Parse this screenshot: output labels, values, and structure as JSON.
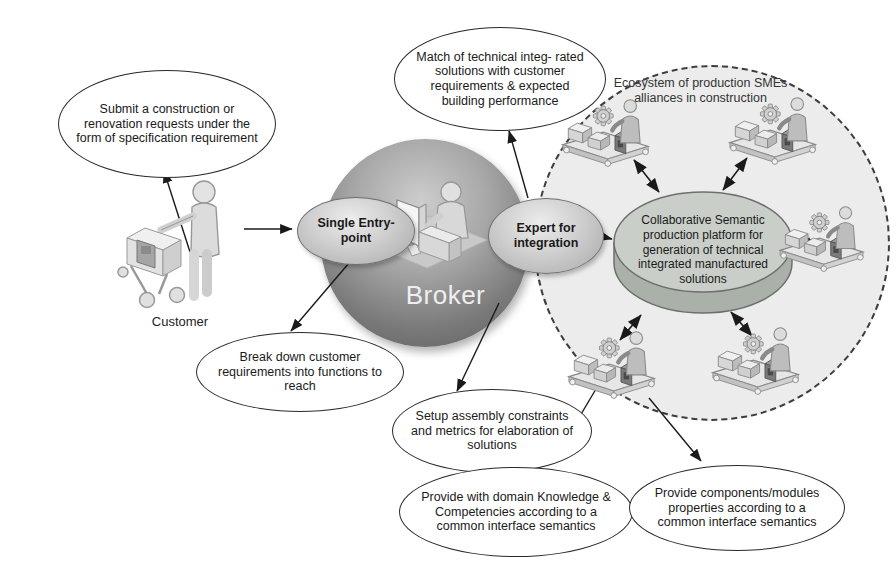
{
  "labels": {
    "broker": "Broker",
    "customer": "Customer"
  },
  "nodes": {
    "submit": "Submit a construction or renovation requests under the form of specification requirement",
    "match": "Match of technical integ- rated solutions with customer requirements & expected building performance",
    "ecosystem": "Ecosystem of production SMEs alliances in construction",
    "platform": "Collaborative Semantic production platform for generation of technical integrated manufactured solutions",
    "single_entry": "Single Entry-point",
    "expert": "Expert for integration",
    "break_down": "Break down customer requirements into functions to reach",
    "setup": "Setup assembly constraints and metrics for elaboration of solutions",
    "knowledge": "Provide with domain Knowledge & Competencies according to a common interface semantics",
    "components": "Provide components/modules properties according to a common interface semantics"
  },
  "icons": {
    "customer": "person-pushing-cart-icon",
    "broker": "person-at-computer-icon",
    "sme": "factory-worker-icon"
  },
  "colors": {
    "background": "#ffffff",
    "broker_sphere": "#6f6f6f",
    "gray_node": "#c3c3c3",
    "ecosystem_fill": "#ececec",
    "cylinder_top": "#c9cec9",
    "cylinder_side": "#a9b1a9",
    "outline": "#1c1c1c"
  }
}
